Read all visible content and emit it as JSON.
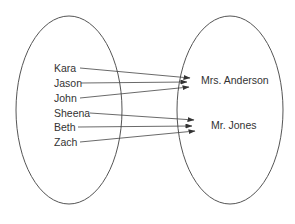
{
  "diagram": {
    "colors": {
      "stroke": "#555555",
      "text": "#333333",
      "background": "#ffffff"
    },
    "domain_set": {
      "name": "students",
      "ellipse": {
        "cx": 69,
        "cy": 110,
        "rx": 53,
        "ry": 94
      },
      "items": [
        {
          "label": "Kara",
          "x": 54,
          "y": 72
        },
        {
          "label": "Jason",
          "x": 54,
          "y": 87
        },
        {
          "label": "John",
          "x": 54,
          "y": 102
        },
        {
          "label": "Sheena",
          "x": 54,
          "y": 117
        },
        {
          "label": "Beth",
          "x": 54,
          "y": 131
        },
        {
          "label": "Zach",
          "x": 54,
          "y": 146
        }
      ]
    },
    "range_set": {
      "name": "teachers",
      "ellipse": {
        "cx": 230,
        "cy": 110,
        "rx": 53,
        "ry": 94
      },
      "items": [
        {
          "label": "Mrs. Anderson",
          "x": 201,
          "y": 84
        },
        {
          "label": "Mr. Jones",
          "x": 211,
          "y": 129
        }
      ]
    },
    "mappings": [
      {
        "from": "Kara",
        "to": "Mrs. Anderson",
        "x1": 80,
        "y1": 68,
        "x2": 190,
        "y2": 78
      },
      {
        "from": "Jason",
        "to": "Mrs. Anderson",
        "x1": 81,
        "y1": 83,
        "x2": 187,
        "y2": 82
      },
      {
        "from": "John",
        "to": "Mrs. Anderson",
        "x1": 80,
        "y1": 98,
        "x2": 189,
        "y2": 87
      },
      {
        "from": "Sheena",
        "to": "Mr. Jones",
        "x1": 90,
        "y1": 113,
        "x2": 194,
        "y2": 120
      },
      {
        "from": "Beth",
        "to": "Mr. Jones",
        "x1": 78,
        "y1": 127,
        "x2": 192,
        "y2": 126
      },
      {
        "from": "Zach",
        "to": "Mr. Jones",
        "x1": 80,
        "y1": 142,
        "x2": 195,
        "y2": 131
      }
    ]
  }
}
